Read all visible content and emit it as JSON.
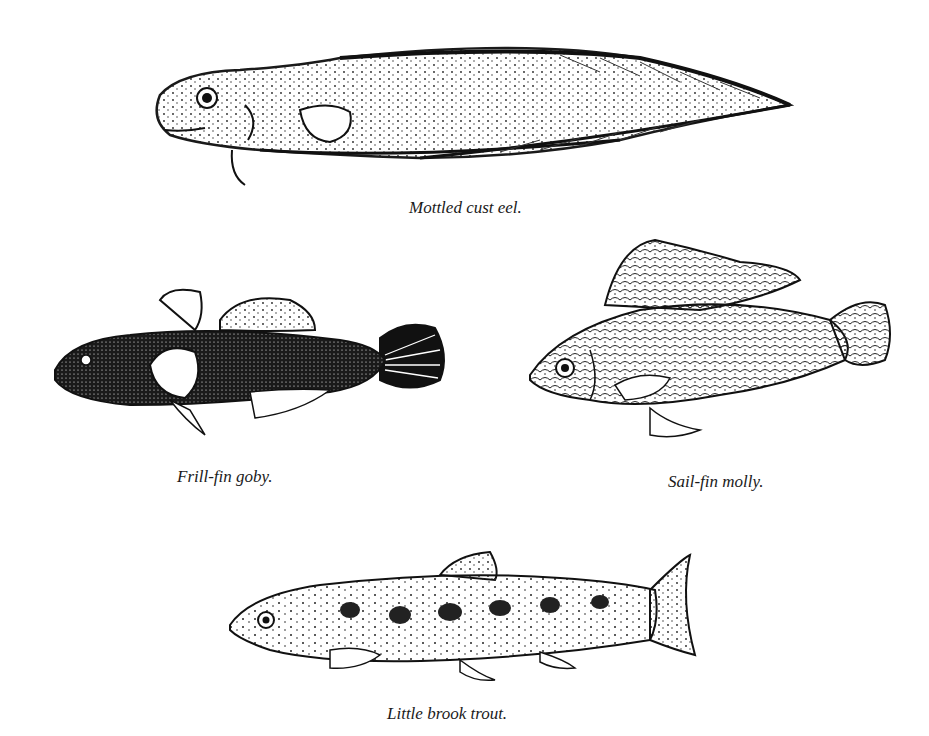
{
  "figures": [
    {
      "id": "mottled-cust-eel",
      "caption": "Mottled cust eel."
    },
    {
      "id": "frill-fin-goby",
      "caption": "Frill-fin goby."
    },
    {
      "id": "sail-fin-molly",
      "caption": "Sail-fin molly."
    },
    {
      "id": "little-brook-trout",
      "caption": "Little brook trout."
    }
  ],
  "colors": {
    "ink": "#1a1a1a",
    "background": "#ffffff"
  }
}
